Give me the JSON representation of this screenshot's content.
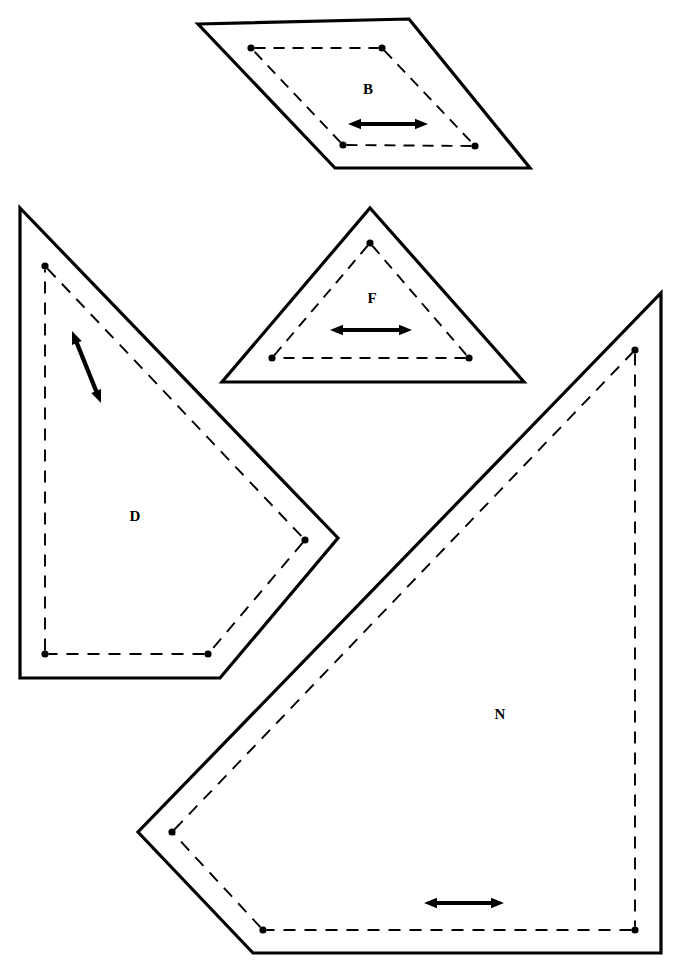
{
  "figure": {
    "background_color": "#ffffff",
    "stroke_color": "#000000",
    "width": 680,
    "height": 970
  },
  "shapes": [
    {
      "id": "B",
      "label": "B",
      "kind": "parallelogram",
      "label_position": {
        "x": 368,
        "y": 91
      },
      "outline_points": "198,24 409,19 530,168 335,168",
      "dashed_points": "251,48 382,48 475,146 343,145",
      "dots": [
        {
          "x": 251,
          "y": 48
        },
        {
          "x": 382,
          "y": 48
        },
        {
          "x": 475,
          "y": 146
        },
        {
          "x": 343,
          "y": 145
        }
      ],
      "arrow": {
        "type": "double-headed",
        "orientation": "horizontal",
        "x1": 348,
        "y1": 124,
        "x2": 428,
        "y2": 124
      }
    },
    {
      "id": "F",
      "label": "F",
      "kind": "triangle",
      "label_position": {
        "x": 372,
        "y": 300
      },
      "outline_points": "370,208 524,382 222,382",
      "dashed_points": "370,243 469,358 272,358",
      "dots": [
        {
          "x": 370,
          "y": 243
        },
        {
          "x": 469,
          "y": 358
        },
        {
          "x": 272,
          "y": 358
        }
      ],
      "arrow": {
        "type": "double-headed",
        "orientation": "horizontal",
        "x1": 330,
        "y1": 330,
        "x2": 412,
        "y2": 330
      }
    },
    {
      "id": "D",
      "label": "D",
      "kind": "concave-polygon",
      "label_position": {
        "x": 135,
        "y": 518
      },
      "outline_points": "20,208 338,538 220,678 20,678",
      "dashed_points": "45,266 305,540 208,654 45,654",
      "dots": [
        {
          "x": 45,
          "y": 266
        },
        {
          "x": 305,
          "y": 540
        },
        {
          "x": 208,
          "y": 654
        },
        {
          "x": 45,
          "y": 654
        }
      ],
      "arrow": {
        "type": "double-headed",
        "orientation": "diagonal",
        "x1": 72,
        "y1": 331,
        "x2": 101,
        "y2": 403
      }
    },
    {
      "id": "N",
      "label": "N",
      "kind": "concave-polygon",
      "label_position": {
        "x": 500,
        "y": 716
      },
      "outline_points": "661,293 661,953 253,953 138,832",
      "dashed_points": "635,350 635,930 263,930 172,832",
      "dots": [
        {
          "x": 635,
          "y": 350
        },
        {
          "x": 635,
          "y": 930
        },
        {
          "x": 263,
          "y": 930
        },
        {
          "x": 172,
          "y": 832
        }
      ],
      "arrow": {
        "type": "double-headed",
        "orientation": "horizontal",
        "x1": 424,
        "y1": 903,
        "x2": 504,
        "y2": 903
      }
    }
  ]
}
